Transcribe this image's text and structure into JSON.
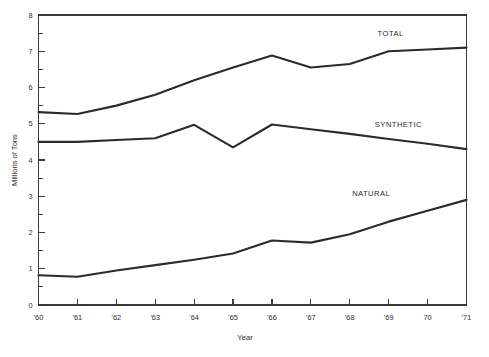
{
  "chart_data": {
    "type": "line",
    "title": "",
    "subtitle": "",
    "xlabel": "Year",
    "ylabel": "Millions of Tons",
    "x": [
      "'60",
      "'61",
      "'62",
      "'63",
      "'64",
      "'65",
      "'66",
      "'67",
      "'68",
      "'69",
      "70",
      "'71"
    ],
    "x_tick_labels": [
      "'60",
      "'61",
      "'62",
      "'63",
      "'64",
      "'65",
      "'66",
      "'67",
      "'68",
      "'69",
      "70",
      "'71"
    ],
    "y_tick_labels": [
      "0",
      "1",
      "2",
      "3",
      "4",
      "5",
      "6",
      "7",
      "8"
    ],
    "xlim": [
      0,
      11
    ],
    "ylim": [
      0,
      8
    ],
    "y_major_step": 1,
    "y_minor_step": 0.5,
    "grid": false,
    "legend": "inline-annotations",
    "legend_position": "in-plot-right",
    "series": [
      {
        "name": "TOTAL",
        "label": "TOTAL",
        "color": "#2b2b2b",
        "values": [
          5.32,
          5.27,
          5.5,
          5.8,
          6.2,
          6.55,
          6.88,
          6.55,
          6.65,
          7.0,
          7.05,
          7.1
        ]
      },
      {
        "name": "SYNTHETIC",
        "label": "SYNTHETIC",
        "color": "#2b2b2b",
        "values": [
          4.5,
          4.5,
          4.55,
          4.6,
          4.97,
          4.35,
          4.98,
          4.85,
          4.72,
          4.58,
          4.45,
          4.3
        ]
      },
      {
        "name": "NATURAL",
        "label": "NATURAL",
        "color": "#2b2b2b",
        "values": [
          0.82,
          0.78,
          0.95,
          1.1,
          1.25,
          1.42,
          1.78,
          1.72,
          1.95,
          2.3,
          2.6,
          2.9
        ]
      }
    ],
    "annotations": [
      {
        "text": "TOTAL",
        "x_index": 9.05,
        "y_value": 7.42
      },
      {
        "text": "SYNTHETIC",
        "x_index": 9.25,
        "y_value": 4.92
      },
      {
        "text": "NATURAL",
        "x_index": 8.55,
        "y_value": 3.02
      }
    ]
  },
  "axes": {
    "y_axis_title": "Millions of Tons",
    "x_axis_title": "Year"
  }
}
